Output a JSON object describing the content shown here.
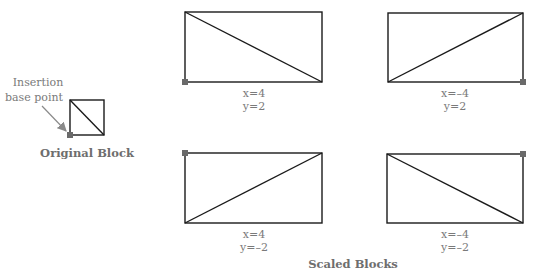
{
  "colors": {
    "line": "#1a1a1a",
    "marker": "#6a6a6a",
    "text": "#7a7a7a",
    "arrow": "#8a8a8a"
  },
  "original": {
    "callout_line1": "Insertion",
    "callout_line2": "base point",
    "caption": "Original Block"
  },
  "scaled": {
    "caption": "Scaled Blocks",
    "blocks": [
      {
        "x_label": "x=4",
        "y_label": "y=2",
        "marker_corner": "bottom-left",
        "diagonal": "top-left to bottom-right"
      },
      {
        "x_label": "x=–4",
        "y_label": "y=2",
        "marker_corner": "bottom-right",
        "diagonal": "bottom-left to top-right"
      },
      {
        "x_label": "x=4",
        "y_label": "y=–2",
        "marker_corner": "top-left",
        "diagonal": "bottom-left to top-right"
      },
      {
        "x_label": "x=–4",
        "y_label": "y=–2",
        "marker_corner": "top-right",
        "diagonal": "top-left to bottom-right"
      }
    ]
  }
}
